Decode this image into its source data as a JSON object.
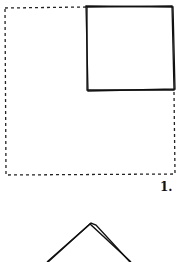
{
  "figure": {
    "label": "1.",
    "shapes": [
      {
        "type": "dashed-rectangle",
        "description": "outer dashed square"
      },
      {
        "type": "solid-square",
        "description": "small square in top-right corner"
      },
      {
        "type": "chevron",
        "description": "partial triangle / roof shape below"
      }
    ],
    "stroke_color": "#111111"
  }
}
